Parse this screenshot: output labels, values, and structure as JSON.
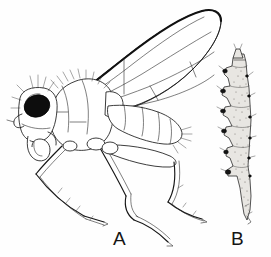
{
  "figure": {
    "kind": "scientific-line-illustration",
    "background_color": "#fefefe",
    "ink_color": "#1a1a1a",
    "width_px": 271,
    "height_px": 257,
    "panels": [
      {
        "id": "A",
        "label": "A",
        "label_x": 113,
        "label_y": 229,
        "caption": "A",
        "subject": "adult fly, lateral view",
        "parts": [
          "head",
          "compound-eye",
          "proboscis",
          "antenna",
          "thorax",
          "wing",
          "abdomen",
          "foreleg",
          "midleg",
          "hindleg",
          "bristles"
        ],
        "eye_color": "#0d0d0d",
        "wing_costa_color": "#111111"
      },
      {
        "id": "B",
        "label": "B",
        "label_x": 231,
        "label_y": 229,
        "caption": "B",
        "subject": "larva, lateral view",
        "parts": [
          "anterior-segment",
          "body-segments",
          "lateral-papillae",
          "spiracles",
          "posterior-tail",
          "stippled-texture"
        ],
        "body_fill": "#e8e6e2",
        "papilla_color": "#141414"
      }
    ]
  }
}
